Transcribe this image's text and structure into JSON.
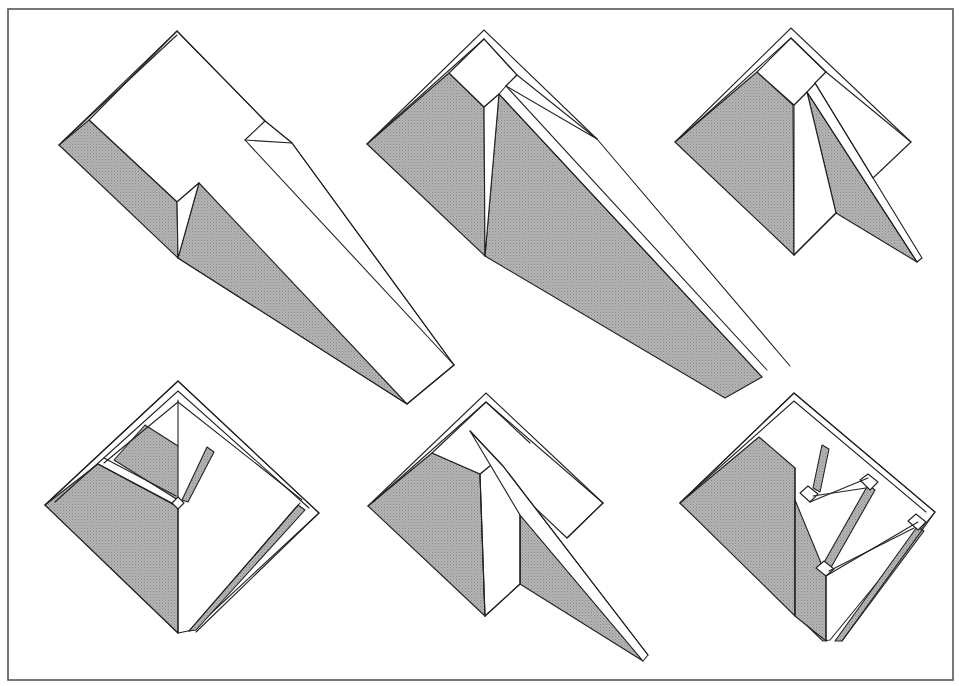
{
  "canvas": {
    "width": 959,
    "height": 686,
    "background": "#ffffff"
  },
  "frame": {
    "x": 8,
    "y": 9,
    "width": 945,
    "height": 671,
    "color": "#555555"
  },
  "colors": {
    "shade_base": "#b4b4b4",
    "shade_dot": "#8a8a8a",
    "line": "#222222"
  },
  "figures": [
    {
      "id": "fold-1",
      "name": "figure-top-left",
      "faces": [
        {
          "type": "white",
          "points": [
            [
              177,
              31
            ],
            [
              265,
              121
            ],
            [
              292,
              143
            ],
            [
              454,
              365
            ],
            [
              407,
              404
            ],
            [
              178,
              258
            ],
            [
              199,
              183
            ],
            [
              177,
              202
            ],
            [
              89,
              120
            ]
          ]
        },
        {
          "type": "shade",
          "points": [
            [
              59,
              145
            ],
            [
              89,
              120
            ],
            [
              177,
              202
            ],
            [
              178,
              258
            ]
          ]
        },
        {
          "type": "shade",
          "points": [
            [
              178,
              258
            ],
            [
              199,
              183
            ],
            [
              407,
              404
            ]
          ]
        },
        {
          "type": "white",
          "points": [
            [
              177,
              202
            ],
            [
              199,
              183
            ],
            [
              178,
              258
            ]
          ]
        },
        {
          "type": "white",
          "points": [
            [
              265,
              121
            ],
            [
              292,
              143
            ],
            [
              245,
              140
            ]
          ]
        }
      ],
      "edges": [
        [
          [
            59,
            145
          ],
          [
            177,
            31
          ],
          [
            265,
            121
          ]
        ],
        [
          [
            62,
            142
          ],
          [
            177,
            35
          ]
        ],
        [
          [
            245,
            140
          ],
          [
            454,
            365
          ]
        ],
        [
          [
            292,
            143
          ],
          [
            454,
            365
          ]
        ],
        [
          [
            407,
            404
          ],
          [
            454,
            365
          ]
        ]
      ]
    },
    {
      "id": "fold-2",
      "name": "figure-top-center",
      "faces": [
        {
          "type": "shade",
          "points": [
            [
              367,
              144
            ],
            [
              449,
              73
            ],
            [
              484,
              107
            ],
            [
              485,
              256
            ]
          ]
        },
        {
          "type": "shade",
          "points": [
            [
              485,
              256
            ],
            [
              499,
              94
            ],
            [
              762,
              377
            ],
            [
              725,
              398
            ]
          ]
        },
        {
          "type": "white",
          "points": [
            [
              484,
              107
            ],
            [
              499,
              94
            ],
            [
              485,
              256
            ]
          ]
        },
        {
          "type": "white",
          "points": [
            [
              449,
              73
            ],
            [
              484,
              39
            ],
            [
              517,
              75
            ],
            [
              506,
              86
            ],
            [
              499,
              94
            ],
            [
              484,
              107
            ]
          ]
        },
        {
          "type": "white",
          "points": [
            [
              506,
              86
            ],
            [
              517,
              75
            ],
            [
              597,
              139
            ]
          ]
        }
      ],
      "edges": [
        [
          [
            367,
            144
          ],
          [
            484,
            30
          ],
          [
            597,
            139
          ]
        ],
        [
          [
            371,
            140
          ],
          [
            484,
            39
          ],
          [
            517,
            75
          ]
        ],
        [
          [
            506,
            86
          ],
          [
            767,
            370
          ]
        ],
        [
          [
            499,
            94
          ],
          [
            762,
            377
          ]
        ],
        [
          [
            597,
            139
          ],
          [
            790,
            366
          ]
        ]
      ]
    },
    {
      "id": "fold-3",
      "name": "figure-top-right",
      "faces": [
        {
          "type": "shade",
          "points": [
            [
              675,
              142
            ],
            [
              757,
              72
            ],
            [
              793,
              105
            ],
            [
              794,
              255
            ]
          ]
        },
        {
          "type": "shade",
          "points": [
            [
              807,
              92
            ],
            [
              836,
              213
            ],
            [
              917,
              262
            ]
          ]
        },
        {
          "type": "white",
          "points": [
            [
              794,
              105
            ],
            [
              807,
              92
            ],
            [
              836,
              213
            ],
            [
              794,
              255
            ]
          ]
        },
        {
          "type": "white",
          "points": [
            [
              757,
              72
            ],
            [
              791,
              38
            ],
            [
              826,
              72
            ],
            [
              807,
              92
            ],
            [
              794,
              105
            ]
          ]
        },
        {
          "type": "white",
          "points": [
            [
              815,
              83
            ],
            [
              826,
              72
            ],
            [
              911,
              142
            ],
            [
              873,
              178
            ]
          ]
        }
      ],
      "edges": [
        [
          [
            675,
            142
          ],
          [
            791,
            28
          ],
          [
            911,
            142
          ]
        ],
        [
          [
            680,
            138
          ],
          [
            791,
            38
          ],
          [
            826,
            72
          ]
        ],
        [
          [
            815,
            83
          ],
          [
            922,
            258
          ],
          [
            917,
            262
          ]
        ],
        [
          [
            807,
            92
          ],
          [
            917,
            262
          ]
        ],
        [
          [
            794,
            255
          ],
          [
            836,
            213
          ]
        ]
      ]
    },
    {
      "id": "fold-4",
      "name": "figure-bottom-left",
      "faces": [
        {
          "type": "white",
          "points": [
            [
              178,
              381
            ],
            [
              319,
              513
            ],
            [
              193,
              630
            ],
            [
              178,
              633
            ],
            [
              45,
              505
            ]
          ]
        },
        {
          "type": "shade",
          "points": [
            [
              45,
              505
            ],
            [
              98,
              464
            ],
            [
              178,
              507
            ],
            [
              178,
              633
            ]
          ]
        },
        {
          "type": "shade",
          "points": [
            [
              114,
              460
            ],
            [
              145,
              425
            ],
            [
              178,
              446
            ],
            [
              178,
              500
            ]
          ]
        },
        {
          "type": "shade",
          "points": [
            [
              182,
              500
            ],
            [
              207,
              447
            ],
            [
              214,
              452
            ],
            [
              188,
              502
            ]
          ]
        },
        {
          "type": "shade",
          "points": [
            [
              298,
              505
            ],
            [
              305,
              510
            ],
            [
              196,
              630
            ],
            [
              189,
              631
            ]
          ]
        },
        {
          "type": "white",
          "points": [
            [
              172,
              503
            ],
            [
              178,
              497
            ],
            [
              184,
              503
            ],
            [
              178,
              509
            ]
          ]
        }
      ],
      "edges": [
        [
          [
            45,
            505
          ],
          [
            178,
            381
          ],
          [
            319,
            513
          ],
          [
            196,
            632
          ]
        ],
        [
          [
            55,
            502
          ],
          [
            178,
            391
          ],
          [
            309,
            508
          ]
        ],
        [
          [
            104,
            463
          ],
          [
            178,
            402
          ],
          [
            302,
            500
          ]
        ],
        [
          [
            98,
            464
          ],
          [
            172,
            503
          ]
        ],
        [
          [
            104,
            458
          ],
          [
            176,
            496
          ]
        ],
        [
          [
            178,
            446
          ],
          [
            178,
            400
          ]
        ],
        [
          [
            178,
            509
          ],
          [
            178,
            633
          ]
        ],
        [
          [
            300,
            503
          ],
          [
            189,
            631
          ]
        ]
      ]
    },
    {
      "id": "fold-5",
      "name": "figure-bottom-center",
      "faces": [
        {
          "type": "shade",
          "points": [
            [
              368,
              506
            ],
            [
              432,
              453
            ],
            [
              480,
              474
            ],
            [
              485,
              616
            ]
          ]
        },
        {
          "type": "shade",
          "points": [
            [
              520,
              584
            ],
            [
              520,
              515
            ],
            [
              643,
              661
            ]
          ]
        },
        {
          "type": "white",
          "points": [
            [
              480,
              474
            ],
            [
              497,
              460
            ],
            [
              520,
              515
            ],
            [
              520,
              584
            ],
            [
              485,
              616
            ]
          ]
        },
        {
          "type": "white",
          "points": [
            [
              432,
              453
            ],
            [
              486,
              402
            ],
            [
              603,
              503
            ],
            [
              567,
              538
            ],
            [
              530,
              503
            ],
            [
              497,
              460
            ],
            [
              480,
              474
            ]
          ]
        },
        {
          "type": "white",
          "points": [
            [
              470,
              431
            ],
            [
              503,
              466
            ],
            [
              648,
              655
            ],
            [
              643,
              661
            ],
            [
              520,
              515
            ]
          ]
        }
      ],
      "edges": [
        [
          [
            368,
            506
          ],
          [
            486,
            393
          ],
          [
            603,
            503
          ]
        ],
        [
          [
            373,
            502
          ],
          [
            486,
            402
          ],
          [
            530,
            443
          ]
        ],
        [
          [
            480,
            474
          ],
          [
            485,
            616
          ]
        ],
        [
          [
            520,
            515
          ],
          [
            520,
            584
          ],
          [
            485,
            616
          ]
        ],
        [
          [
            567,
            538
          ],
          [
            603,
            503
          ]
        ],
        [
          [
            470,
            431
          ],
          [
            503,
            466
          ],
          [
            648,
            655
          ]
        ]
      ]
    },
    {
      "id": "fold-6",
      "name": "figure-bottom-right",
      "faces": [
        {
          "type": "white",
          "points": [
            [
              794,
              393
            ],
            [
              935,
              512
            ],
            [
              830,
              640
            ],
            [
              823,
              641
            ],
            [
              680,
              503
            ]
          ]
        },
        {
          "type": "shade",
          "points": [
            [
              680,
              503
            ],
            [
              759,
              437
            ],
            [
              795,
              468
            ],
            [
              795,
              616
            ]
          ]
        },
        {
          "type": "shade",
          "points": [
            [
              795,
              500
            ],
            [
              826,
              575
            ],
            [
              826,
              641
            ],
            [
              795,
              616
            ]
          ]
        },
        {
          "type": "shade",
          "points": [
            [
              813,
              488
            ],
            [
              822,
              445
            ],
            [
              829,
              449
            ],
            [
              820,
              492
            ]
          ]
        },
        {
          "type": "shade",
          "points": [
            [
              868,
              485
            ],
            [
              875,
              490
            ],
            [
              829,
              571
            ],
            [
              822,
              566
            ]
          ]
        },
        {
          "type": "shade",
          "points": [
            [
              917,
              527
            ],
            [
              924,
              531
            ],
            [
              842,
              641
            ],
            [
              835,
              641
            ]
          ]
        },
        {
          "type": "white",
          "points": [
            [
              800,
              493
            ],
            [
              808,
              486
            ],
            [
              818,
              494
            ],
            [
              810,
              502
            ]
          ]
        },
        {
          "type": "white",
          "points": [
            [
              860,
              480
            ],
            [
              868,
              474
            ],
            [
              878,
              482
            ],
            [
              870,
              490
            ]
          ]
        },
        {
          "type": "white",
          "points": [
            [
              816,
              568
            ],
            [
              824,
              561
            ],
            [
              834,
              569
            ],
            [
              826,
              576
            ]
          ]
        },
        {
          "type": "white",
          "points": [
            [
              908,
              521
            ],
            [
              916,
              514
            ],
            [
              926,
              522
            ],
            [
              918,
              530
            ]
          ]
        }
      ],
      "edges": [
        [
          [
            680,
            503
          ],
          [
            794,
            393
          ],
          [
            935,
            512
          ],
          [
            842,
            641
          ]
        ],
        [
          [
            684,
            499
          ],
          [
            794,
            401
          ],
          [
            926,
            512
          ]
        ],
        [
          [
            795,
            468
          ],
          [
            795,
            616
          ]
        ],
        [
          [
            810,
            502
          ],
          [
            868,
            478
          ]
        ],
        [
          [
            813,
            496
          ],
          [
            866,
            488
          ]
        ],
        [
          [
            826,
            576
          ],
          [
            918,
            522
          ]
        ],
        [
          [
            829,
            571
          ],
          [
            914,
            528
          ]
        ],
        [
          [
            826,
            576
          ],
          [
            826,
            641
          ]
        ]
      ]
    }
  ]
}
